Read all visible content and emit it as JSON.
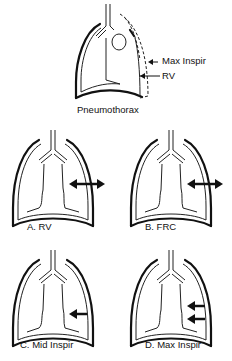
{
  "figure": {
    "top": {
      "caption": "Pneumothorax",
      "label_max": "Max Inspir",
      "label_rv": "RV"
    },
    "panels": [
      {
        "id": "A",
        "caption": "A.  RV",
        "arrow": "double"
      },
      {
        "id": "B",
        "caption": "B.  FRC",
        "arrow": "double"
      },
      {
        "id": "C",
        "caption": "C.  Mid  Inspir",
        "arrow": "left-single"
      },
      {
        "id": "D",
        "caption": "D.  Max  Inspir",
        "arrow": "left-double"
      }
    ]
  }
}
